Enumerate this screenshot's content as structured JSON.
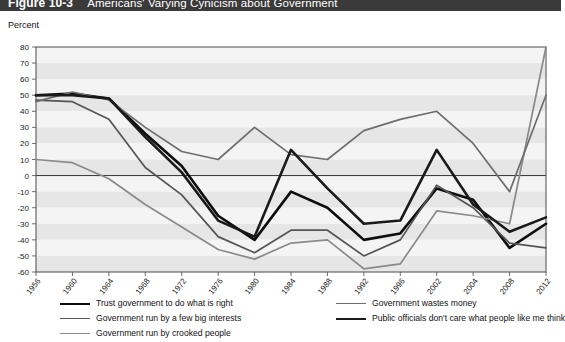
{
  "figure": {
    "number": "Figure 10-3",
    "title": "Americans' Varying Cynicism about Government"
  },
  "axis": {
    "y_title": "Percent",
    "y_ticks": [
      "80",
      "70",
      "60",
      "50",
      "40",
      "30",
      "20",
      "10",
      "0",
      "-10",
      "-20",
      "-30",
      "-40",
      "-50",
      "-60"
    ],
    "x_ticks": [
      "1956",
      "1960",
      "1964",
      "1968",
      "1972",
      "1976",
      "1980",
      "1984",
      "1988",
      "1992",
      "1996",
      "2002",
      "2004",
      "2008",
      "2012"
    ]
  },
  "legend": {
    "left": [
      {
        "label": "Trust government to do what is right",
        "color": "#0d0d0d",
        "width": 2.6
      },
      {
        "label": "Government run by a few big interests",
        "color": "#555555",
        "width": 1.7
      },
      {
        "label": "Government run by crooked people",
        "color": "#8a8a8a",
        "width": 1.7
      }
    ],
    "right": [
      {
        "label": "Government wastes money",
        "color": "#6e6e6e",
        "width": 1.7
      },
      {
        "label": "Public officials don't care what people like me think",
        "color": "#1a1a1a",
        "width": 2.6
      }
    ]
  },
  "colors": {
    "title_bar": "#3a3a3a",
    "plot_border": "#4a4a4a",
    "band_light": "#e6e6e6",
    "band_pale": "#f4f4f4",
    "zero_line": "#333333"
  },
  "chart_data": {
    "type": "line",
    "title": "Americans' Varying Cynicism about Government",
    "xlabel": "",
    "ylabel": "Percent",
    "xlim": [
      1956,
      2012
    ],
    "ylim": [
      -60,
      80
    ],
    "ytick_step": 10,
    "grid": "horizontal-bands",
    "legend_position": "bottom",
    "x": [
      1956,
      1960,
      1964,
      1968,
      1972,
      1976,
      1980,
      1984,
      1988,
      1992,
      1996,
      2000,
      2004,
      2008,
      2012
    ],
    "series": [
      {
        "name": "Trust government to do what is right",
        "color": "#0d0d0d",
        "width": 2.6,
        "values": [
          50,
          51,
          48,
          26,
          6,
          -25,
          -40,
          -10,
          -20,
          -40,
          -36,
          -8,
          -15,
          -45,
          -30
        ]
      },
      {
        "name": "Government run by a few big interests",
        "color": "#555555",
        "width": 1.7,
        "values": [
          47,
          46,
          35,
          5,
          -12,
          -38,
          -48,
          -34,
          -34,
          -50,
          -40,
          -6,
          -20,
          -42,
          -45
        ]
      },
      {
        "name": "Government run by crooked people",
        "color": "#8a8a8a",
        "width": 1.7,
        "values": [
          10,
          8,
          -2,
          -18,
          -32,
          -46,
          -52,
          -42,
          -40,
          -58,
          -55,
          -22,
          -25,
          -30,
          80
        ]
      },
      {
        "name": "Government wastes money",
        "color": "#6e6e6e",
        "width": 1.7,
        "values": [
          46,
          52,
          47,
          30,
          15,
          10,
          30,
          13,
          10,
          28,
          35,
          40,
          20,
          -10,
          50
        ]
      },
      {
        "name": "Public officials don't care what people like me think",
        "color": "#1a1a1a",
        "width": 2.6,
        "values": [
          50,
          50,
          48,
          24,
          2,
          -28,
          -38,
          16,
          -8,
          -30,
          -28,
          16,
          -18,
          -35,
          -26
        ]
      }
    ]
  }
}
